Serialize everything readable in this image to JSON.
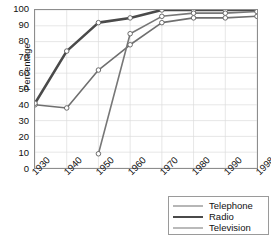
{
  "chart_data": {
    "type": "line",
    "title": "",
    "xlabel": "",
    "ylabel": "Percentage",
    "x": [
      "1930",
      "1940",
      "1950",
      "1960",
      "1970",
      "1980",
      "1990",
      "1998"
    ],
    "xlim": [
      0,
      7
    ],
    "ylim": [
      0,
      100
    ],
    "yticks": [
      0,
      10,
      20,
      30,
      40,
      50,
      60,
      70,
      80,
      90,
      100
    ],
    "grid": true,
    "legend_position": "bottom-right",
    "series": [
      {
        "name": "Telephone",
        "color": "#6f6f6f",
        "width": 1.6,
        "values": [
          40,
          38,
          62,
          78,
          92,
          95,
          95,
          96
        ]
      },
      {
        "name": "Radio",
        "color": "#4a4a4a",
        "width": 2.6,
        "values": [
          41,
          74,
          92,
          95,
          100,
          100,
          100,
          100
        ]
      },
      {
        "name": "Television",
        "color": "#777777",
        "width": 1.6,
        "values": [
          null,
          null,
          9,
          85,
          96,
          98,
          98,
          99
        ]
      }
    ]
  },
  "axis": {
    "y_title": "Percentage",
    "y_tick_labels": [
      "100",
      "90",
      "80",
      "70",
      "60",
      "50",
      "40",
      "30",
      "20",
      "10",
      "0"
    ],
    "x_tick_labels": [
      "1930",
      "1940",
      "1950",
      "1960",
      "1970",
      "1980",
      "1990",
      "1998"
    ]
  },
  "legend": {
    "entries": [
      {
        "label": "Telephone"
      },
      {
        "label": "Radio"
      },
      {
        "label": "Television"
      }
    ]
  },
  "colors": {
    "grid": "#dcdcdc",
    "frame": "#8d8d8d",
    "marker_fill": "#ffffff",
    "marker_stroke": "#5a5a5a",
    "text": "#111111",
    "background": "#ffffff"
  }
}
